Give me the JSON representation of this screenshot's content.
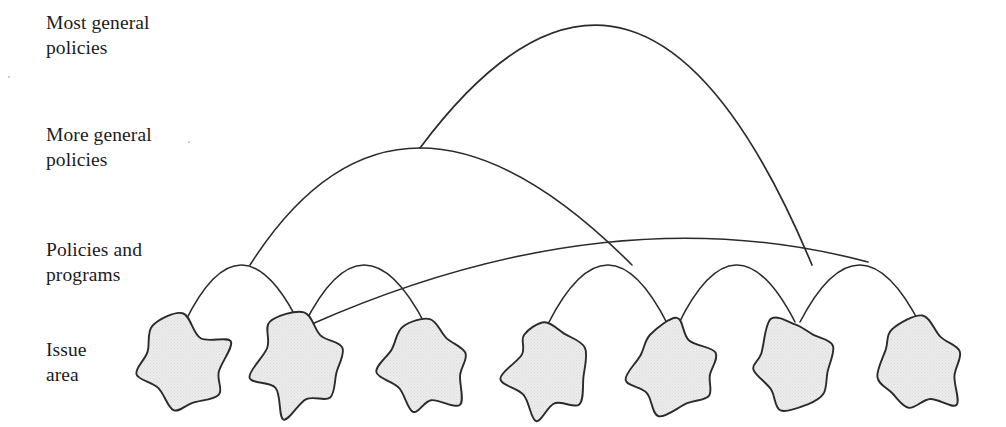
{
  "figure": {
    "background_color": "#ffffff",
    "stroke_color": "#2b2b2b",
    "blob_fill_color": "#e9e9e9",
    "text_color": "#1c1c1c",
    "width": 1006,
    "height": 427
  },
  "tiers": [
    {
      "label": "Most general\npolicies",
      "level": 1,
      "y": 30
    },
    {
      "label": "More general\npolicies",
      "level": 2,
      "y": 148
    },
    {
      "label": "Policies and\nprograms",
      "level": 3,
      "y": 265
    },
    {
      "label": "Issue\narea",
      "level": 4,
      "y": 365
    }
  ],
  "chart_data": {
    "type": "diagram",
    "tier_labels": [
      "Most general policies",
      "More general policies",
      "Policies and programs",
      "Issue area"
    ],
    "node_count": 7,
    "nodes": [
      {
        "id": "issue-1",
        "cx": 185,
        "cy": 365,
        "rx": 46,
        "ry": 44,
        "seed": 11
      },
      {
        "id": "issue-2",
        "cx": 300,
        "cy": 368,
        "rx": 44,
        "ry": 47,
        "seed": 23
      },
      {
        "id": "issue-3",
        "cx": 425,
        "cy": 368,
        "rx": 42,
        "ry": 45,
        "seed": 37
      },
      {
        "id": "issue-4",
        "cx": 548,
        "cy": 368,
        "rx": 42,
        "ry": 46,
        "seed": 51
      },
      {
        "id": "issue-5",
        "cx": 673,
        "cy": 368,
        "rx": 46,
        "ry": 45,
        "seed": 67
      },
      {
        "id": "issue-6",
        "cx": 795,
        "cy": 366,
        "rx": 43,
        "ry": 45,
        "seed": 83
      },
      {
        "id": "issue-7",
        "cx": 920,
        "cy": 368,
        "rx": 45,
        "ry": 46,
        "seed": 97
      }
    ],
    "arcs": [
      {
        "id": "arc-l3-a",
        "level": 3,
        "from": [
          185,
          322
        ],
        "to": [
          300,
          325
        ],
        "apex": [
          242,
          265
        ]
      },
      {
        "id": "arc-l3-b",
        "level": 3,
        "from": [
          304,
          325
        ],
        "to": [
          425,
          324
        ],
        "apex": [
          364,
          265
        ]
      },
      {
        "id": "arc-l3-c",
        "level": 3,
        "from": [
          548,
          324
        ],
        "to": [
          668,
          325
        ],
        "apex": [
          608,
          265
        ]
      },
      {
        "id": "arc-l3-d",
        "level": 3,
        "from": [
          678,
          325
        ],
        "to": [
          795,
          322
        ],
        "apex": [
          736,
          265
        ]
      },
      {
        "id": "arc-l3-e",
        "level": 3,
        "from": [
          800,
          322
        ],
        "to": [
          920,
          324
        ],
        "apex": [
          860,
          265
        ]
      },
      {
        "id": "arc-l2-a",
        "level": 2,
        "from": [
          250,
          265
        ],
        "to": [
          632,
          265
        ],
        "apex": [
          420,
          148
        ]
      },
      {
        "id": "arc-l2-b",
        "level": 2,
        "from": [
          312,
          324
        ],
        "to": [
          868,
          262
        ],
        "apex": [
          600,
          243
        ]
      },
      {
        "id": "arc-l1-a",
        "level": 1,
        "from": [
          420,
          148
        ],
        "to": [
          812,
          265
        ],
        "apex": [
          628,
          30
        ]
      }
    ],
    "axis": {
      "grid": false,
      "legend": false
    }
  },
  "artifacts": [
    {
      "name": "scan-speck",
      "x": 188,
      "y": 141
    },
    {
      "name": "scan-speck",
      "x": 8,
      "y": 76
    }
  ]
}
